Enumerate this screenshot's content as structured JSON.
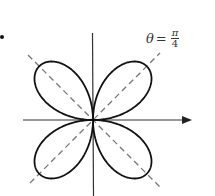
{
  "figure": {
    "curve": "r = a sin(2θ)",
    "label": {
      "variable": "θ",
      "equals": "=",
      "numerator": "π",
      "denominator": "4"
    },
    "axes": {
      "horizontal": "x-axis with arrow pointing right",
      "vertical": "y-axis"
    },
    "dashed_lines": [
      "θ = π/4",
      "θ = 3π/4"
    ],
    "colors": {
      "curve": "#111111",
      "axes": "#333333",
      "dashed": "#777777",
      "background": "#ffffff"
    }
  }
}
